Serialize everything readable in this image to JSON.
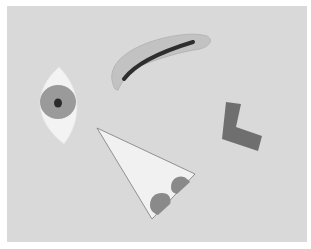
{
  "image": {
    "description": "Paper cutout shapes arranged on a light gray background",
    "background_color": "#d9d9d9",
    "border_color": "#ffffff",
    "shapes": [
      {
        "name": "eye",
        "fill": "#f3f3f3",
        "iris": "#9a9a9a",
        "pupil": "#2a2a2a"
      },
      {
        "name": "eyebrow",
        "fill": "#c2c2c2",
        "stroke": "#2e2e2e"
      },
      {
        "name": "triangle-nose",
        "fill": "#f1f1f1",
        "spots": "#8a8a8a"
      },
      {
        "name": "l-shape",
        "fill": "#6f6f6f"
      }
    ]
  }
}
